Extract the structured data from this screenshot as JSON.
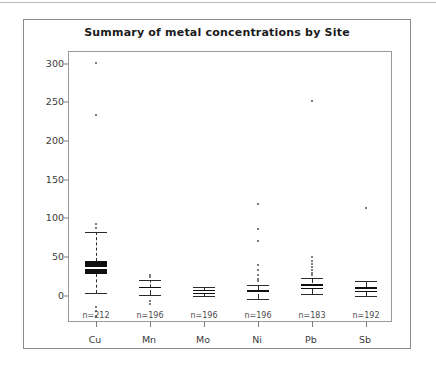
{
  "chart_data": {
    "type": "box",
    "title": "Summary of metal concentrations by Site",
    "xlabel": "",
    "ylabel": "",
    "ylim": [
      -35,
      315
    ],
    "yticks": [
      0,
      50,
      100,
      150,
      200,
      250,
      300
    ],
    "grid": false,
    "legend": "none",
    "categories": [
      "Cu",
      "Mn",
      "Mo",
      "Ni",
      "Pb",
      "Sb"
    ],
    "counts": [
      "n=212",
      "n=196",
      "n=196",
      "n=196",
      "n=183",
      "n=192"
    ],
    "boxes": [
      {
        "category": "Cu",
        "n": 212,
        "whisker_low": 4,
        "q1": 28,
        "median": 36,
        "q3": 45,
        "whisker_high": 82,
        "outliers": [
          301,
          233,
          93,
          88,
          -14,
          -19,
          -26
        ]
      },
      {
        "category": "Mn",
        "n": 196,
        "whisker_low": 1,
        "q1": 7,
        "median": 9,
        "q3": 12,
        "whisker_high": 21,
        "outliers": [
          25,
          27,
          -7,
          -10
        ]
      },
      {
        "category": "Mo",
        "n": 196,
        "whisker_low": 0,
        "q1": 3,
        "median": 5,
        "q3": 7,
        "whisker_high": 11,
        "outliers": []
      },
      {
        "category": "Ni",
        "n": 196,
        "whisker_low": -4,
        "q1": 2,
        "median": 4,
        "q3": 7,
        "whisker_high": 14,
        "outliers": [
          119,
          86,
          71,
          40,
          33,
          27,
          22,
          19
        ]
      },
      {
        "category": "Pb",
        "n": 183,
        "whisker_low": 2,
        "q1": 9,
        "median": 12,
        "q3": 16,
        "whisker_high": 23,
        "outliers": [
          252,
          50,
          45,
          41,
          37,
          33,
          30,
          27
        ]
      },
      {
        "category": "Sb",
        "n": 192,
        "whisker_low": 0,
        "q1": 5,
        "median": 8,
        "q3": 11,
        "whisker_high": 19,
        "outliers": [
          113
        ]
      }
    ]
  },
  "colors": {
    "box_fill": "#101010",
    "axis": "#7d7d7d",
    "frame": "#9a9a9a",
    "outer_frame": "#8d8d8d",
    "text": "#3a3a3a",
    "title": "#1b1b1b"
  }
}
